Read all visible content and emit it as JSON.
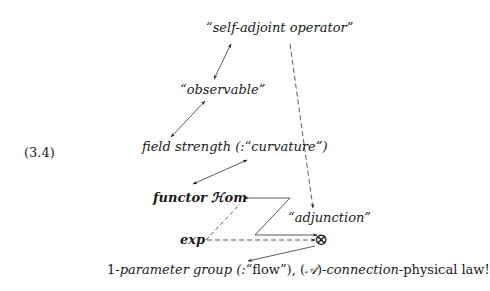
{
  "equation_number": "(3.4)",
  "nodes": {
    "self_adjoint": "“self-adjoint operator”",
    "observable": "“observable”",
    "field_strength": {
      "main": "field strength (:“curvature”)"
    },
    "functor_hom": "functor ℋom",
    "adjunction": "“adjunction”",
    "exp": "exp",
    "otimes": "⊗",
    "bottom": {
      "part1_upright": "1-",
      "part2_italic": "parameter group (:",
      "part3_upright": "“flow”), (",
      "part4_script": "𝒜",
      "part5_upright": ")-",
      "part6_italic": "connection",
      "part7_upright": "-physical law!"
    }
  },
  "edges": [
    {
      "from": "self_adjoint",
      "to": "observable",
      "style": "solid",
      "heads": "both"
    },
    {
      "from": "observable",
      "to": "field_strength",
      "style": "solid",
      "heads": "both"
    },
    {
      "from": "field_strength",
      "to": "functor_hom",
      "style": "solid",
      "heads": "both"
    },
    {
      "from": "self_adjoint",
      "to": "adjunction",
      "style": "dashed",
      "heads": "end"
    },
    {
      "from": "z_path",
      "to": "functor_hom",
      "style": "solid",
      "heads": "end"
    },
    {
      "from": "z_path",
      "to": "otimes",
      "style": "solid",
      "heads": "end"
    },
    {
      "from": "exp",
      "to": "functor_hom",
      "style": "dashed",
      "heads": "none"
    },
    {
      "from": "exp",
      "to": "otimes",
      "style": "dashed",
      "heads": "end"
    },
    {
      "from": "otimes",
      "to": "bottom",
      "style": "solid",
      "heads": "end"
    }
  ]
}
